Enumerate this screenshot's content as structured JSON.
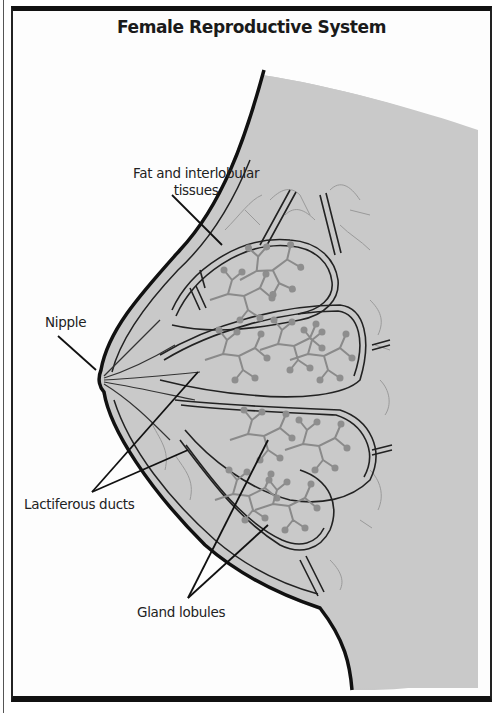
{
  "diagram": {
    "title": "Female Reproductive System",
    "labels": {
      "fat_line1": "Fat and interlobular",
      "fat_line2": "tissues",
      "nipple": "Nipple",
      "lactiferous": "Lactiferous ducts",
      "gland": "Gland lobules"
    },
    "colors": {
      "outline": "#111111",
      "tissue_fill": "#c9c9c9",
      "body_shadow": "#bdbdbd",
      "gland_branch": "#8a8a8a",
      "frame": "#111111",
      "background": "#fdfdfd"
    }
  }
}
